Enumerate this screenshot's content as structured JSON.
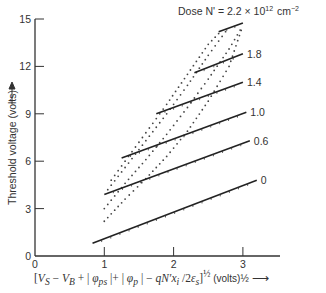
{
  "chart_data": {
    "type": "line",
    "title": "",
    "legend_title": "Dose N' = 2.2 × 10¹² cm⁻²",
    "xlabel": "[V_S − V_B + |φ_ps| + |φ_p| − qN'x_i/2ε_s]^½ (volts)^½",
    "ylabel": "Threshold voltage (volts)",
    "xlim": [
      0,
      3.5
    ],
    "ylim": [
      0,
      15
    ],
    "x_ticks": [
      "0",
      "1",
      "2",
      "3"
    ],
    "y_ticks": [
      "0",
      "3",
      "6",
      "9",
      "12",
      "15"
    ],
    "grid": false,
    "series": [
      {
        "name": "0",
        "label": "0",
        "x": [
          0.83,
          3.2
        ],
        "y": [
          0.8,
          4.8
        ]
      },
      {
        "name": "0.6",
        "label": "0.6",
        "x": [
          1.0,
          3.1
        ],
        "y": [
          3.9,
          7.3
        ]
      },
      {
        "name": "1.0",
        "label": "1.0",
        "x": [
          1.25,
          3.05
        ],
        "y": [
          6.2,
          9.1
        ]
      },
      {
        "name": "1.4",
        "label": "1.4",
        "x": [
          1.75,
          3.0
        ],
        "y": [
          9.0,
          11.0
        ]
      },
      {
        "name": "1.8",
        "label": "1.8",
        "x": [
          2.3,
          3.0
        ],
        "y": [
          11.6,
          12.8
        ]
      },
      {
        "name": "2.2",
        "label": "",
        "x": [
          2.65,
          3.0
        ],
        "y": [
          14.2,
          14.75
        ]
      }
    ],
    "dotted_curves": [
      {
        "x": [
          1.0,
          1.3,
          1.6,
          1.9,
          2.2,
          2.5,
          2.8,
          3.0
        ],
        "y": [
          2.2,
          3.6,
          4.9,
          6.3,
          7.9,
          9.8,
          12.0,
          14.6
        ]
      },
      {
        "x": [
          1.0,
          1.3,
          1.6,
          1.9,
          2.2,
          2.5,
          2.8,
          3.0
        ],
        "y": [
          3.0,
          4.6,
          6.1,
          7.7,
          9.4,
          11.2,
          13.1,
          14.6
        ]
      },
      {
        "x": [
          1.05,
          1.3,
          1.6,
          1.9,
          2.2,
          2.5,
          2.8
        ],
        "y": [
          4.2,
          5.6,
          7.3,
          9.0,
          10.8,
          12.7,
          14.5
        ]
      },
      {
        "x": [
          1.1,
          1.3,
          1.6,
          1.9,
          2.2,
          2.5,
          2.7
        ],
        "y": [
          4.8,
          6.0,
          7.8,
          9.6,
          11.5,
          13.4,
          14.3
        ]
      }
    ]
  },
  "labels": {
    "legend": "Dose N' = 2.2 × 10",
    "legend_exp": "12",
    "legend_unit": "cm",
    "legend_unit_exp": "−2",
    "ylabel": "Threshold voltage (volts)",
    "x_unit": "(volts)½"
  }
}
